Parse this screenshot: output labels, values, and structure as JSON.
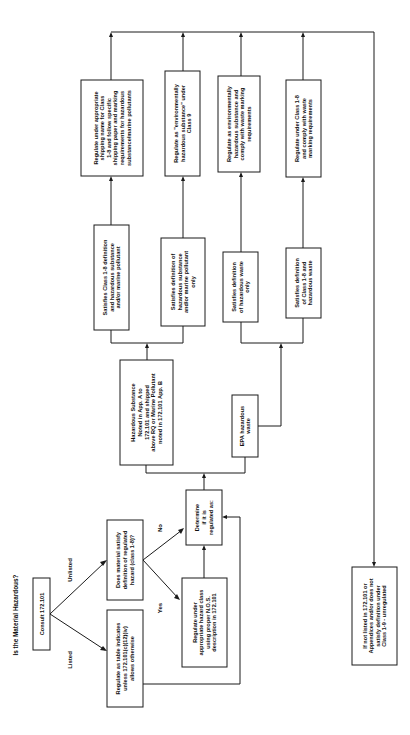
{
  "title": "Is the Material Hazardous?",
  "orientation": "rotated 90 degrees counter-clockwise; flow proceeds left-to-right along page width, text reads bottom-to-top",
  "nodes": {
    "consult": {
      "lines": [
        "Consult 172.101"
      ]
    },
    "listed_label": "Listed",
    "unlisted_label": "Unlisted",
    "regulate_table": {
      "lines": [
        "Regulate as table indicates",
        "unless 172.101(c)(12)(iv)",
        "allows otherwise"
      ]
    },
    "does_material": {
      "lines": [
        "Does material satisfy",
        "definition of regulated",
        "hazard (class 1-8)?"
      ]
    },
    "yes_label": "Yes",
    "no_label": "No",
    "regulate_nos": {
      "lines": [
        "Regulate under",
        "appropriate hazard class",
        "using proper N.O.S.",
        "description in 172.101"
      ]
    },
    "determine": {
      "lines": [
        "Determine",
        "if it is",
        "regulated as:"
      ]
    },
    "hazardous_substance": {
      "lines": [
        "Hazardous Substance",
        "Noted in App. A to",
        "172.101 and shipped",
        "above RQ or Marine Pollutant",
        "noted in 172.101 App. B"
      ]
    },
    "epa_waste": {
      "lines": [
        "EPA hazardous",
        "waste"
      ]
    },
    "sat_class18_hs": {
      "lines": [
        "Satisfies Class 1-8 definition",
        "and hazardous substance",
        "and/or marine pollutant"
      ]
    },
    "sat_hs_only": {
      "lines": [
        "Satisfies definition of",
        "hazardous substance",
        "and/or marine pollutant",
        "only"
      ]
    },
    "sat_hw_only": {
      "lines": [
        "Satisfies definition",
        "of hazardous waste",
        "only"
      ]
    },
    "sat_class18_hw": {
      "lines": [
        "Satisfies definition",
        "of Class 1-8 and",
        "hazardous waste"
      ]
    },
    "reg_shipping": {
      "lines": [
        "Regulate under appropriate",
        "shipping name for Class",
        "1-8 and follow specific",
        "shipping paper and marking",
        "requirements for hazardous",
        "substance/marine pollutants"
      ]
    },
    "reg_env_class9": {
      "lines": [
        "Regulate as \"environmentally",
        "hazardous substance\" under",
        "Class 9"
      ]
    },
    "reg_env_waste": {
      "lines": [
        "Regulate as environmentally",
        "hazardous substance and",
        "comply with waste marking",
        "requirements"
      ]
    },
    "reg_class18_waste": {
      "lines": [
        "Regulate under Class 1-8",
        "and comply with waste",
        "marking requirements"
      ]
    },
    "not_listed": {
      "lines": [
        "If not listed in 172.101 or",
        "Appendices and/or does not",
        "satisfy definition under",
        "Class 1-9 - unregulated"
      ]
    }
  },
  "colors": {
    "ink": "#1a1a1a",
    "background": "#ffffff"
  }
}
